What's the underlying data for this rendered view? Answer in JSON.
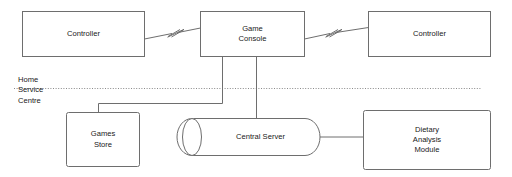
{
  "diagram": {
    "background_color": "#ffffff",
    "stroke_color": "#6e6e6e",
    "text_color": "#202020",
    "zone_divider": {
      "name": "home-service-centre-boundary",
      "style": "dotted",
      "label": "Home\nService\nCentre"
    },
    "nodes": [
      {
        "id": "controller-left",
        "label": "Controller",
        "shape": "rectangle"
      },
      {
        "id": "game-console",
        "label": "Game\nConsole",
        "shape": "rectangle"
      },
      {
        "id": "controller-right",
        "label": "Controller",
        "shape": "rectangle"
      },
      {
        "id": "games-store",
        "label": "Games\nStore",
        "shape": "rectangle"
      },
      {
        "id": "central-server",
        "label": "Central Server",
        "shape": "cylinder"
      },
      {
        "id": "dietary-analysis-module",
        "label": "Dietary\nAnalysis\nModule",
        "shape": "rectangle"
      }
    ],
    "connectors": [
      {
        "id": "controller-left-to-console",
        "from": "controller-left",
        "to": "game-console",
        "style": "wireless-break"
      },
      {
        "id": "console-to-controller-right",
        "from": "game-console",
        "to": "controller-right",
        "style": "wireless-break"
      },
      {
        "id": "console-to-games-store",
        "from": "game-console",
        "to": "games-store",
        "style": "elbow"
      },
      {
        "id": "console-to-central-server",
        "from": "game-console",
        "to": "central-server",
        "style": "straight"
      },
      {
        "id": "central-server-to-dietary",
        "from": "central-server",
        "to": "dietary-analysis-module",
        "style": "straight"
      }
    ]
  }
}
